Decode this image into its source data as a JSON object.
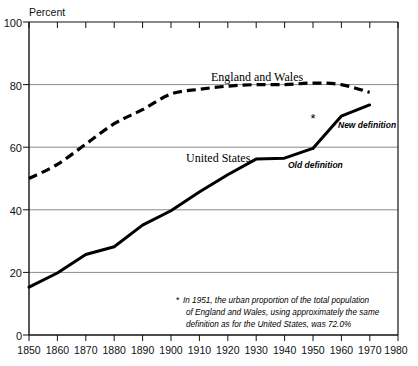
{
  "chart_data": {
    "type": "line",
    "title": "",
    "xlabel": "",
    "ylabel": "Percent",
    "xlim": [
      1850,
      1980
    ],
    "ylim": [
      0,
      100
    ],
    "grid": true,
    "gridlines_y": [
      20,
      40,
      60,
      80
    ],
    "y_ticks": [
      0,
      20,
      40,
      60,
      80,
      100
    ],
    "y_tick_labels": [
      "0",
      "20",
      "40",
      "60",
      "80",
      "100"
    ],
    "x_ticks": [
      1850,
      1860,
      1870,
      1880,
      1890,
      1900,
      1910,
      1920,
      1930,
      1940,
      1950,
      1960,
      1970,
      1980
    ],
    "x_tick_labels": [
      "1850",
      "1860",
      "1870",
      "1880",
      "1890",
      "1900",
      "1910",
      "1920",
      "1930",
      "1940",
      "1950",
      "1960",
      "1970",
      "1980"
    ],
    "legend_position": "inline-annotations",
    "series": [
      {
        "name": "England and Wales",
        "style": "dashed",
        "x": [
          1850,
          1860,
          1870,
          1880,
          1890,
          1900,
          1910,
          1920,
          1930,
          1940,
          1950,
          1960,
          1970
        ],
        "values": [
          50.0,
          54.5,
          61.0,
          67.5,
          72.0,
          77.0,
          78.5,
          79.5,
          80.0,
          80.0,
          80.5,
          80.0,
          77.5
        ]
      },
      {
        "name": "United States",
        "style": "solid",
        "sublabel": "Old definition",
        "x": [
          1850,
          1860,
          1870,
          1880,
          1890,
          1900,
          1910,
          1920,
          1930,
          1940,
          1950
        ],
        "values": [
          15.3,
          19.8,
          25.7,
          28.2,
          35.1,
          39.7,
          45.7,
          51.2,
          56.2,
          56.5,
          59.6
        ]
      },
      {
        "name": "United States",
        "style": "solid",
        "sublabel": "New definition",
        "x": [
          1950,
          1960,
          1970
        ],
        "values": [
          59.6,
          69.9,
          73.5
        ]
      }
    ],
    "annotations": [
      {
        "id": "england-and-wales-label",
        "text": "England and Wales",
        "x": 1925,
        "y": 86
      },
      {
        "id": "united-states-label",
        "text": "United States",
        "x": 1886,
        "y": 57.5
      },
      {
        "id": "old-definition-label",
        "text": "Old definition",
        "x": 1946,
        "y": 55
      },
      {
        "id": "new-definition-label",
        "text": "New definition",
        "x": 1962,
        "y": 69
      },
      {
        "id": "asterisk-marker",
        "text": "*",
        "x": 1952,
        "y": 70.5
      }
    ],
    "footnote": {
      "marker": "*",
      "lines": [
        "In 1951, the urban proportion of the total population",
        "of England and Wales, using approximately the same",
        "definition as for the United States, was 72.0%"
      ],
      "full_text": "* In 1951, the urban proportion of the total population of England and Wales, using approximately the same definition as for the United States, was 72.0%"
    },
    "colors": {
      "line": "#000000",
      "grid": "#8a8a8a",
      "axis": "#000000",
      "background": "#ffffff"
    }
  }
}
